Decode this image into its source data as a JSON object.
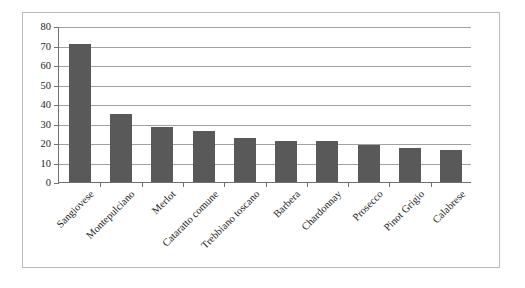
{
  "chart_data": {
    "type": "bar",
    "title": "",
    "subtitle": "",
    "xlabel": "",
    "ylabel": "",
    "categories": [
      "Sangiovese",
      "Montepulciano",
      "Merlot",
      "Cataratto comune",
      "Trebbiano toscano",
      "Barbera",
      "Chardonnay",
      "Prosecco",
      "Pinot Grigio",
      "Calabrese"
    ],
    "values": [
      71,
      35,
      28,
      26,
      22.5,
      21,
      21,
      19,
      17.5,
      16.5
    ],
    "ylim": [
      0,
      80
    ],
    "ytick_labels": [
      "0",
      "10",
      "20",
      "30",
      "40",
      "50",
      "60",
      "70",
      "80"
    ],
    "ytick_values": [
      0,
      10,
      20,
      30,
      40,
      50,
      60,
      70,
      80
    ],
    "grid": "horizontal",
    "legend": "none",
    "bar_color": "#595959",
    "gridline_color": "#9fa1a3",
    "axis_color": "#6f7072",
    "frame_color": "#b9bbbd",
    "background_color": "#ffffff",
    "label_rotation_degrees": -45
  }
}
